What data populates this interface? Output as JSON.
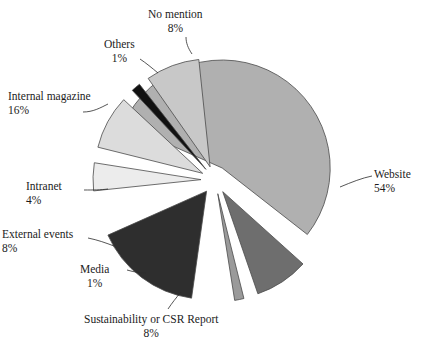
{
  "chart_data": {
    "type": "pie",
    "title": "",
    "subtitle": "",
    "xlabel": "",
    "ylabel": "",
    "legend_position": "none",
    "grid": false,
    "labels_show_percent": true,
    "exploded": true,
    "categories": [
      "Website",
      "Internal magazine",
      "No mention",
      "External events",
      "Sustainability or CSR Report",
      "Intranet",
      "Others",
      "Media"
    ],
    "values": [
      54,
      16,
      8,
      8,
      8,
      4,
      1,
      1
    ],
    "unit": "%",
    "colors": [
      "#b0b0b0",
      "#2e2e2e",
      "#6e6e6e",
      "#dcdcdc",
      "#c8c8c8",
      "#ececec",
      "#9a9a9a",
      "#111111"
    ],
    "slices": [
      {
        "name": "Website",
        "value": 54,
        "value_label": "54%",
        "color": "#b0b0b0",
        "start_angle": -66,
        "end_angle": 128,
        "explode": 14,
        "label_x": 374,
        "label_y": 168,
        "label_align": "left",
        "leader": "M 340 187 C 352 182 362 178 372 176"
      },
      {
        "name": "Internal magazine",
        "value": 16,
        "value_label": "16%",
        "color": "#2e2e2e",
        "start_angle": 188,
        "end_angle": 246,
        "explode": 14,
        "label_x": 8,
        "label_y": 90,
        "label_align": "left",
        "leader": "M 83 112 C 93 112 100 108 108 104"
      },
      {
        "name": "No mention",
        "value": 8,
        "value_label": "8%",
        "color": "#6e6e6e",
        "start_angle": 132,
        "end_angle": 161,
        "explode": 14,
        "label_x": 148,
        "label_y": 8,
        "label_align": "center",
        "leader": "M 186 37 C 186 43 188 48 192 54"
      },
      {
        "name": "External events",
        "value": 8,
        "value_label": "8%",
        "color": "#dcdcdc",
        "start_angle": 284,
        "end_angle": 313,
        "explode": 14,
        "label_x": 2,
        "label_y": 228,
        "label_align": "left",
        "leader": "M 88 238 C 98 240 106 243 114 246"
      },
      {
        "name": "Sustainability or CSR Report",
        "value": 8,
        "value_label": "8%",
        "color": "#c8c8c8",
        "start_angle": 325,
        "end_angle": 354,
        "explode": 14,
        "label_x": 84,
        "label_y": 313,
        "label_align": "center",
        "leader": "M 168 309 C 172 303 176 298 181 292"
      },
      {
        "name": "Intranet",
        "value": 4,
        "value_label": "4%",
        "color": "#ececec",
        "start_angle": 264,
        "end_angle": 279,
        "explode": 14,
        "label_x": 26,
        "label_y": 180,
        "label_align": "left",
        "leader": "M 84 190 C 94 190 100 190 108 189"
      },
      {
        "name": "Others",
        "value": 1,
        "value_label": "1%",
        "color": "#9a9a9a",
        "start_angle": 166,
        "end_angle": 171,
        "explode": 14,
        "label_x": 104,
        "label_y": 38,
        "label_align": "center",
        "leader": "M 140 59 C 146 63 152 68 158 73"
      },
      {
        "name": "Media",
        "value": 1,
        "value_label": "1%",
        "color": "#111111",
        "start_angle": 317,
        "end_angle": 322,
        "explode": 14,
        "label_x": 80,
        "label_y": 263,
        "label_align": "center",
        "leader": "M 127 270 C 134 272 140 273 146 273"
      }
    ],
    "center": [
      215,
      180
    ],
    "radius": 108,
    "total": 100,
    "background_color": "#ffffff",
    "text_color": "#1c1c1c",
    "outline_color": "#4a4a4a"
  }
}
